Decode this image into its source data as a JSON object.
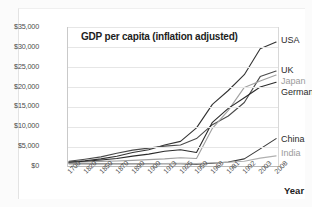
{
  "chart_data": {
    "type": "line",
    "title": "GDP per capita (inflation adjusted)",
    "xlabel": "Year",
    "ylabel": "",
    "grid": true,
    "legend_position": "inline-right-endpoints",
    "ylim": [
      0,
      35000
    ],
    "ytick_labels": [
      "$35,000",
      "$30,000",
      "$25,000",
      "$20,000",
      "$15,000",
      "$10,000",
      "$5,000",
      "$0"
    ],
    "ytick_values": [
      35000,
      30000,
      25000,
      20000,
      15000,
      10000,
      5000,
      0
    ],
    "categories": [
      "1700",
      "1820",
      "1850",
      "1870",
      "1890",
      "1900",
      "1913",
      "1925",
      "1950",
      "1968",
      "1981",
      "1992",
      "2003",
      "2008"
    ],
    "series": [
      {
        "name": "USA",
        "color": "#333333",
        "values": [
          1000,
          1300,
          1800,
          2450,
          3400,
          4100,
          5300,
          6200,
          9600,
          15500,
          19000,
          23000,
          29500,
          31200
        ]
      },
      {
        "name": "UK",
        "color": "#4a4a4a",
        "values": [
          1200,
          1700,
          2300,
          3200,
          4000,
          4500,
          5000,
          5300,
          6900,
          10400,
          12600,
          16000,
          22500,
          23900
        ]
      },
      {
        "name": "Japan",
        "color": "#a0a0a0",
        "values": [
          900,
          1000,
          1150,
          1250,
          1400,
          1600,
          1800,
          2100,
          1900,
          9500,
          14000,
          19800,
          21400,
          22900
        ]
      },
      {
        "name": "Germany",
        "color": "#2b2b2b",
        "values": [
          950,
          1200,
          1500,
          1900,
          2500,
          3000,
          3700,
          4100,
          3400,
          11000,
          14500,
          17200,
          19900,
          21100
        ]
      },
      {
        "name": "China",
        "color": "#3a3a3a",
        "values": [
          600,
          600,
          600,
          580,
          560,
          550,
          560,
          580,
          450,
          700,
          1000,
          1800,
          4300,
          6900
        ]
      },
      {
        "name": "India",
        "color": "#b0b0b0",
        "values": [
          550,
          530,
          520,
          520,
          540,
          560,
          620,
          660,
          620,
          800,
          950,
          1200,
          2000,
          2550
        ]
      }
    ]
  },
  "labels": {
    "usa": "USA",
    "uk": "UK",
    "japan": "Japan",
    "germany": "Germany",
    "china": "China",
    "india": "India"
  }
}
